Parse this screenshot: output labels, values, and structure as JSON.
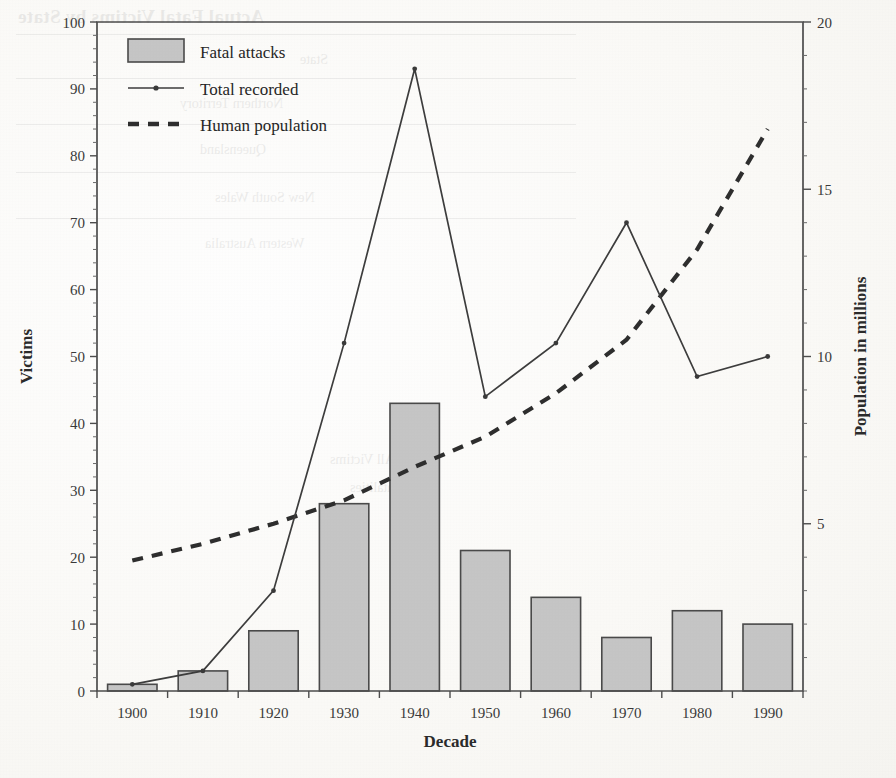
{
  "chart_data": {
    "type": "bar",
    "title": "",
    "xlabel": "Decade",
    "ylabel": "Victims",
    "y2label": "Population in millions",
    "categories": [
      "1900",
      "1910",
      "1920",
      "1930",
      "1940",
      "1950",
      "1960",
      "1970",
      "1980",
      "1990"
    ],
    "ylim": [
      0,
      100
    ],
    "y2lim": [
      0,
      20
    ],
    "yticks": [
      0,
      10,
      20,
      30,
      40,
      50,
      60,
      70,
      80,
      90,
      100
    ],
    "y2ticks": [
      5,
      10,
      15,
      20
    ],
    "grid": false,
    "legend_position": "top-left",
    "series": [
      {
        "name": "Fatal attacks",
        "type": "bar",
        "axis": "left",
        "values": [
          1,
          3,
          9,
          28,
          43,
          21,
          14,
          8,
          12,
          10
        ]
      },
      {
        "name": "Total recorded",
        "type": "line",
        "axis": "left",
        "values": [
          1,
          3,
          15,
          52,
          93,
          44,
          52,
          70,
          47,
          50
        ]
      },
      {
        "name": "Human population",
        "type": "line",
        "axis": "right",
        "style": "dashed",
        "values": [
          3.9,
          4.4,
          5.0,
          5.7,
          6.7,
          7.6,
          8.9,
          10.5,
          13.2,
          16.8
        ]
      }
    ]
  },
  "axes": {
    "left_title": "Victims",
    "right_title": "Population in millions",
    "bottom_title": "Decade",
    "left_ticks": [
      "0",
      "10",
      "20",
      "30",
      "40",
      "50",
      "60",
      "70",
      "80",
      "90",
      "100"
    ],
    "right_ticks": [
      "5",
      "10",
      "15",
      "20"
    ],
    "bottom_ticks": [
      "1900",
      "1910",
      "1920",
      "1930",
      "1940",
      "1950",
      "1960",
      "1970",
      "1980",
      "1990"
    ]
  },
  "legend": {
    "items": [
      {
        "label": "Fatal attacks",
        "marker": "filled-box"
      },
      {
        "label": "Total recorded",
        "marker": "line-with-point"
      },
      {
        "label": "Human population",
        "marker": "dashed-line"
      }
    ]
  },
  "colors": {
    "bar_fill": "#c6c6c6",
    "bar_stroke": "#4a4a4a",
    "line": "#3d3d3d",
    "dashed_line": "#2e2e2e",
    "axis": "#4d4d4d",
    "page_background": "#fdfdfb"
  },
  "bleed_through": {
    "title": "Actual Fatal Victims by State",
    "header": "State",
    "rows": [
      "Northern Territory",
      "Queensland",
      "New South Wales",
      "Western Australia"
    ],
    "footnote_1": "All Victims",
    "footnote_2": "Fatalities"
  }
}
